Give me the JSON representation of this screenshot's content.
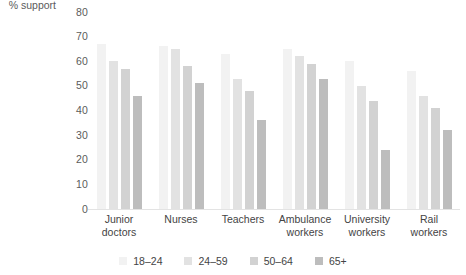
{
  "axis_title": "% support",
  "legend": {
    "items": [
      {
        "label": "18–24",
        "color": "#f2f2f2"
      },
      {
        "label": "24–59",
        "color": "#e2e2e2"
      },
      {
        "label": "50–64",
        "color": "#d2d2d2"
      },
      {
        "label": "65+",
        "color": "#bdbdbd"
      }
    ]
  },
  "chart_data": {
    "type": "bar",
    "title": "",
    "xlabel": "",
    "ylabel": "% support",
    "ylim": [
      0,
      80
    ],
    "yticks": [
      80,
      70,
      60,
      50,
      40,
      30,
      20,
      10,
      0
    ],
    "grid": false,
    "legend_position": "bottom",
    "categories": [
      "Junior doctors",
      "Nurses",
      "Teachers",
      "Ambulance workers",
      "University workers",
      "Rail workers"
    ],
    "series": [
      {
        "name": "18–24",
        "color": "#f2f2f2",
        "values": [
          67,
          66,
          63,
          65,
          60,
          56
        ]
      },
      {
        "name": "24–59",
        "color": "#e2e2e2",
        "values": [
          60,
          65,
          53,
          62,
          50,
          46
        ]
      },
      {
        "name": "50–64",
        "color": "#d2d2d2",
        "values": [
          57,
          58,
          48,
          59,
          44,
          41
        ]
      },
      {
        "name": "65+",
        "color": "#bdbdbd",
        "values": [
          46,
          51,
          36,
          53,
          24,
          32
        ]
      }
    ]
  }
}
